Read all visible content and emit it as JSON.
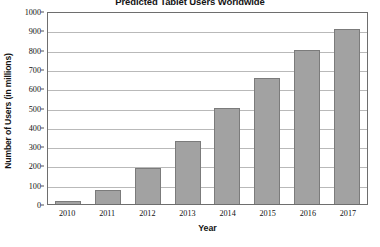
{
  "chart_data": {
    "type": "bar",
    "title": "Predicted Tablet Users Worldwide",
    "xlabel": "Year",
    "ylabel": "Number of Users (in millions)",
    "categories": [
      "2010",
      "2011",
      "2012",
      "2013",
      "2014",
      "2015",
      "2016",
      "2017"
    ],
    "values": [
      18,
      75,
      185,
      325,
      495,
      655,
      800,
      905
    ],
    "ylim": [
      0,
      1000
    ],
    "ytick_step": 100,
    "yticks": [
      "0",
      "100",
      "200",
      "300",
      "400",
      "500",
      "600",
      "700",
      "800",
      "900",
      "1000"
    ],
    "grid": "horizontal",
    "legend": "none",
    "bar_color": "#a2a2a2",
    "bar_border_color": "#7b7b7b",
    "gridline_color": "#b9b9b9",
    "axis_color": "#6e6e6e",
    "background_color": "#ffffff",
    "text_color": "#111111"
  }
}
